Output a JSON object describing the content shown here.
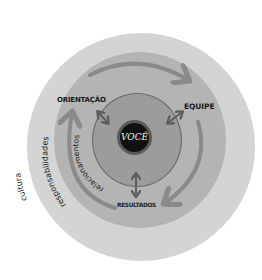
{
  "diagram": {
    "type": "concentric-circles",
    "layers": [
      {
        "id": "cultura",
        "label": "cultura",
        "color": "#d4d4d4",
        "order": 1
      },
      {
        "id": "responsabilidades",
        "label": "responsabilidades",
        "color": "#b4b4b4",
        "order": 2
      },
      {
        "id": "relacionamentos",
        "label": "relacionamentos",
        "color": "#9c9c9c",
        "order": 3
      },
      {
        "id": "voce",
        "label": "VOCÊ",
        "color": "#111111",
        "order": 4
      }
    ],
    "center": {
      "label": "VOCÊ"
    },
    "nodes": [
      {
        "id": "orientacao",
        "label": "ORIENTAÇÃO"
      },
      {
        "id": "equipe",
        "label": "EQUIPE"
      },
      {
        "id": "resultados",
        "label": "RESULTADOS"
      }
    ],
    "cycle": {
      "direction": "clockwise",
      "sequence": [
        "ORIENTAÇÃO",
        "EQUIPE",
        "RESULTADOS"
      ],
      "arrow_color": "#8a8a8a"
    },
    "links": [
      {
        "from": "VOCÊ",
        "to": "ORIENTAÇÃO",
        "type": "bidirectional"
      },
      {
        "from": "VOCÊ",
        "to": "EQUIPE",
        "type": "bidirectional"
      },
      {
        "from": "VOCÊ",
        "to": "RESULTADOS",
        "type": "bidirectional"
      }
    ],
    "ring_labels": {
      "outer": "cultura",
      "middle": "responsabilidades",
      "inner": "relacionamentos"
    }
  }
}
